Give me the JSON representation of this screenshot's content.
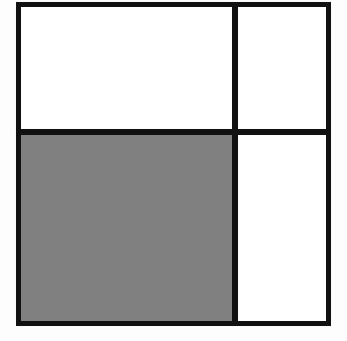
{
  "figure": {
    "canvas": {
      "width": 347,
      "height": 341,
      "background_color": "#fdfdfd"
    },
    "outer_square": {
      "label": "outer square",
      "x": 16,
      "y": 2,
      "width": 315,
      "height": 324,
      "stroke_color": "#111111",
      "stroke_width": 5,
      "fill_color": "#ffffff"
    },
    "dividers": [
      {
        "label": "horizontal divider",
        "orientation": "horizontal",
        "position": 129,
        "thickness": 6,
        "color": "#111111",
        "from": 16,
        "to": 331
      },
      {
        "label": "vertical divider",
        "orientation": "vertical",
        "position": 232,
        "thickness": 6,
        "color": "#111111",
        "from": 2,
        "to": 326
      }
    ],
    "cells": [
      {
        "label": "top-left region",
        "shaded": false,
        "fill_color": "#ffffff",
        "x": 21,
        "y": 7,
        "width": 211,
        "height": 122
      },
      {
        "label": "top-right region",
        "shaded": false,
        "fill_color": "#ffffff",
        "x": 238,
        "y": 7,
        "width": 88,
        "height": 122
      },
      {
        "label": "bottom-left region",
        "shaded": true,
        "fill_color": "#808080",
        "x": 21,
        "y": 135,
        "width": 211,
        "height": 186
      },
      {
        "label": "bottom-right region",
        "shaded": false,
        "fill_color": "#ffffff",
        "x": 238,
        "y": 135,
        "width": 88,
        "height": 186
      }
    ],
    "colors": {
      "stroke": "#111111",
      "shaded_fill": "#808080",
      "unshaded_fill": "#ffffff",
      "page_background": "#fdfdfd"
    }
  }
}
